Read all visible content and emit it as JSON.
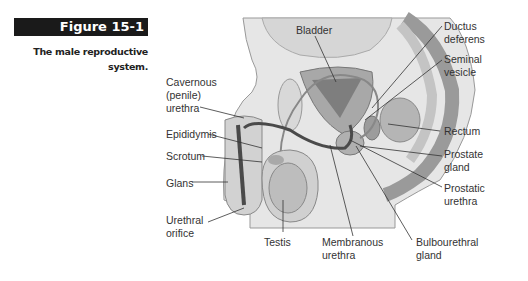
{
  "figure": {
    "number": "Figure 15-1",
    "caption_line1": "The male reproductive",
    "caption_line2": "system."
  },
  "labels": {
    "bladder": "Bladder",
    "ductus_deferens_1": "Ductus",
    "ductus_deferens_2": "deferens",
    "seminal_vesicle_1": "Seminal",
    "seminal_vesicle_2": "vesicle",
    "cavernous_urethra_1": "Cavernous",
    "cavernous_urethra_2": "(penile)",
    "cavernous_urethra_3": "urethra",
    "epididymis": "Epididymis",
    "scrotum": "Scrotum",
    "glans": "Glans",
    "urethral_orifice_1": "Urethral",
    "urethral_orifice_2": "orifice",
    "testis": "Testis",
    "membranous_urethra_1": "Membranous",
    "membranous_urethra_2": "urethra",
    "bulbourethral_gland_1": "Bulbourethral",
    "bulbourethral_gland_2": "gland",
    "rectum": "Rectum",
    "prostate_gland_1": "Prostate",
    "prostate_gland_2": "gland",
    "prostatic_urethra_1": "Prostatic",
    "prostatic_urethra_2": "urethra"
  },
  "colors": {
    "header_bg": "#1a1a1a",
    "tissue_light": "#e4e4e4",
    "tissue_mid": "#bdbdbd",
    "tissue_dark": "#8c8c8c",
    "urethra": "#4a4a4a"
  }
}
